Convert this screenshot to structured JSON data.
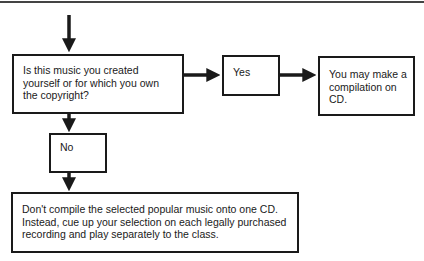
{
  "flowchart": {
    "question": "Is this music you created yourself or for which you own the copyright?",
    "yes_label": "Yes",
    "yes_result": "You may make a compilation on CD.",
    "no_label": "No",
    "no_result": "Don't compile the selected popular music onto one CD. Instead, cue up your selection on each legally purchased recording and play separately to the class."
  },
  "colors": {
    "stroke": "#1a1a1a",
    "background": "#ffffff"
  }
}
